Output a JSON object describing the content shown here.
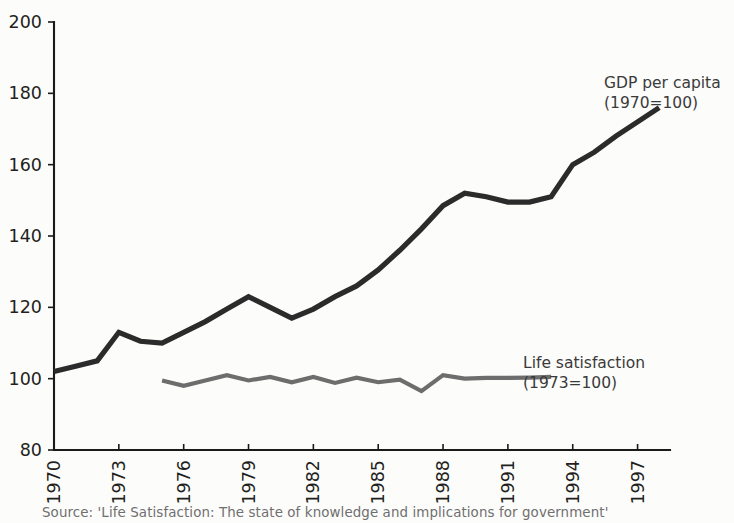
{
  "chart_data": {
    "type": "line",
    "title": "",
    "xlabel": "",
    "ylabel": "",
    "xlim": [
      1970,
      1998.5
    ],
    "ylim": [
      80,
      200
    ],
    "grid": false,
    "legend_position": "inline-annotations",
    "y_ticks": [
      80,
      100,
      120,
      140,
      160,
      180,
      200
    ],
    "x_ticks": [
      1970,
      1973,
      1976,
      1979,
      1982,
      1985,
      1988,
      1991,
      1994,
      1997
    ],
    "series": [
      {
        "name": "GDP per capita (1970=100)",
        "color": "#2b2b2b",
        "x": [
          1970,
          1971,
          1972,
          1973,
          1974,
          1975,
          1976,
          1977,
          1978,
          1979,
          1980,
          1981,
          1982,
          1983,
          1984,
          1985,
          1986,
          1987,
          1988,
          1989,
          1990,
          1991,
          1992,
          1993,
          1994,
          1995,
          1996,
          1997,
          1998
        ],
        "values": [
          102,
          103.5,
          105,
          113,
          110.5,
          110,
          113,
          116,
          119.5,
          123,
          120,
          117,
          119.5,
          123,
          126,
          130.5,
          136,
          142,
          148.5,
          152,
          151,
          149.5,
          149.5,
          151,
          160,
          163.5,
          168,
          172,
          176
        ]
      },
      {
        "name": "Life satisfaction (1973=100)",
        "color": "#6d6d6d",
        "x": [
          1975,
          1976,
          1977,
          1978,
          1979,
          1980,
          1981,
          1982,
          1983,
          1984,
          1985,
          1986,
          1987,
          1988,
          1989,
          1990,
          1991,
          1992,
          1993
        ],
        "values": [
          99.5,
          98,
          99.5,
          101,
          99.5,
          100.5,
          99,
          100.5,
          98.8,
          100.3,
          99,
          99.7,
          96.5,
          101,
          100,
          100.2,
          100.2,
          100.3,
          100.5
        ]
      }
    ],
    "annotations": [
      {
        "id": "gdp-annotation",
        "line1": "GDP per capita",
        "line2": "(1970=100)",
        "x_px": 604,
        "y_px": 88
      },
      {
        "id": "life-satisfaction-annotation",
        "line1": "Life satisfaction",
        "line2": "(1973=100)",
        "x_px": 523,
        "y_px": 368
      }
    ]
  },
  "source": {
    "text": "Source: 'Life Satisfaction: The state of knowledge and implications for government'"
  }
}
